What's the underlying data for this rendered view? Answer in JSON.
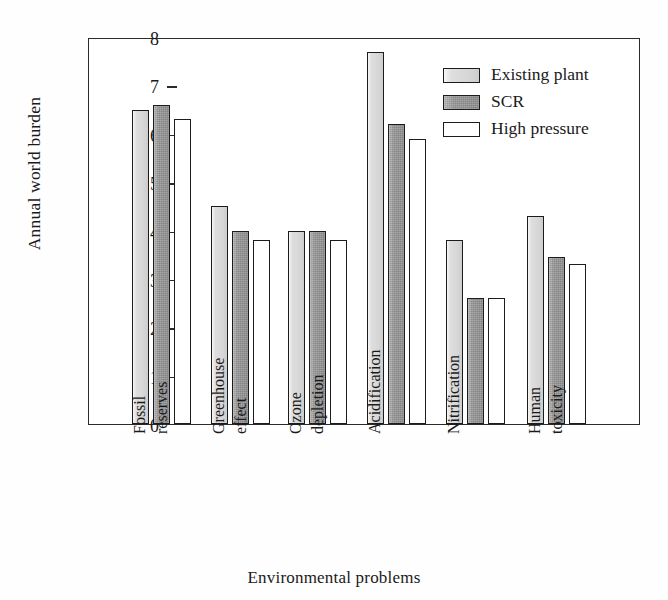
{
  "chart_data": {
    "type": "bar",
    "title": "",
    "xlabel": "Environmental problems",
    "ylabel": "Annual world burden",
    "ylim": [
      0,
      8
    ],
    "yticks": [
      0,
      1,
      2,
      3,
      4,
      5,
      6,
      7,
      8
    ],
    "ytick_labels": [
      "0",
      "1",
      "2",
      "3",
      "4",
      "5",
      "6",
      "7",
      "8"
    ],
    "grid": false,
    "legend_position": "top-right",
    "categories": [
      "Fossil reserves",
      "Greenhouse effect",
      "Ozone depletion",
      "Acidification",
      "Nitrification",
      "Human toxicity"
    ],
    "category_lines": [
      [
        "Fossil",
        "reserves"
      ],
      [
        "Greenhouse",
        "effect"
      ],
      [
        "Ozone",
        "depletion"
      ],
      [
        "Acidification"
      ],
      [
        "Nitrification"
      ],
      [
        "Human",
        "toxicity"
      ]
    ],
    "series": [
      {
        "name": "Existing plant",
        "color": "#dedede",
        "values": [
          6.5,
          4.5,
          4.0,
          7.7,
          3.8,
          4.3
        ]
      },
      {
        "name": "SCR",
        "color": "#888888",
        "values": [
          6.6,
          4.0,
          4.0,
          6.2,
          2.6,
          3.45
        ]
      },
      {
        "name": "High pressure",
        "color": "#ffffff",
        "values": [
          6.3,
          3.8,
          3.8,
          5.9,
          2.6,
          3.3
        ]
      }
    ]
  },
  "colors": {
    "axis": "#2b2b2b",
    "bar_outline": "#1c1c1c",
    "background": "#ffffff",
    "text": "#1a1a1a"
  }
}
